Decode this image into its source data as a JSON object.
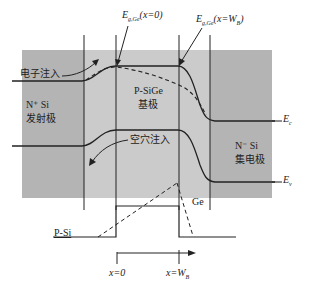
{
  "diagram": {
    "type": "band-diagram",
    "colors": {
      "emitter_region": "#b4b4b4",
      "base_region": "#c8c8c8",
      "collector_region": "#b4b4b4",
      "line": "#222222",
      "background": "#ffffff"
    },
    "annotations": {
      "eg_ge_x0": {
        "main": "E",
        "sub": "g,Ge",
        "rest": "(x=0)"
      },
      "eg_ge_xwb": {
        "main": "E",
        "sub": "g,Ge",
        "rest": "(x=W",
        "sub2": "B",
        "end": ")"
      }
    },
    "labels": {
      "electron_injection": "电子注入",
      "hole_injection": "空穴注入",
      "emitter_line1": "N⁺ Si",
      "emitter_line2": "发射极",
      "base_line1": "P-SiGe",
      "base_line2": "基极",
      "collector_line1": "N⁻ Si",
      "collector_line2": "集电极",
      "ec": {
        "main": "E",
        "sub": "c"
      },
      "ev": {
        "main": "E",
        "sub": "v"
      },
      "ge": "Ge",
      "psi": "P-Si",
      "x0": "x=0",
      "xwb": {
        "main": "x=W",
        "sub": "B"
      }
    }
  }
}
